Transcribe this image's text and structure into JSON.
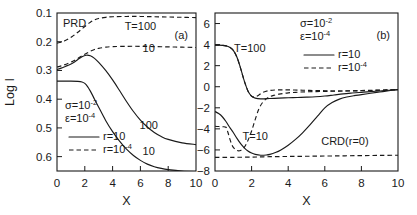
{
  "figure": {
    "width": 417,
    "height": 215,
    "background": "#ffffff",
    "ink": "#1a1a1a"
  },
  "chart_data": [
    {
      "type": "line",
      "panel_label": "(a)",
      "title": "PRD",
      "xlabel": "X",
      "ylabel": "Log I",
      "xlim": [
        0,
        10
      ],
      "ylim": [
        0.1,
        0.65
      ],
      "y_inverted": true,
      "grid": false,
      "xticks": [
        0,
        2,
        4,
        6,
        8,
        10
      ],
      "xtick_labels": [
        "0",
        "2",
        "4",
        "6",
        "8",
        "10"
      ],
      "yticks": [
        0.1,
        0.2,
        0.3,
        0.4,
        0.5,
        0.6
      ],
      "ytick_labels": [
        "0.1",
        "0.2",
        "0.3",
        "0.4",
        "0.5",
        "0.6"
      ],
      "legend": {
        "position": "lower-left",
        "params": [
          {
            "symbol": "σ",
            "value": "10",
            "exponent": "-2"
          },
          {
            "symbol": "ε",
            "value": "10",
            "exponent": "-4"
          }
        ],
        "entries": [
          {
            "style": "solid",
            "label": "r=10",
            "exponent": ""
          },
          {
            "style": "dashed",
            "label": "r=10",
            "exponent": "-4"
          }
        ]
      },
      "annotations": [
        {
          "text": "T=100",
          "x": 6.0,
          "y": 0.158,
          "series": "dashed-T100"
        },
        {
          "text": "10",
          "x": 6.6,
          "y": 0.235,
          "series": "dashed-T10"
        },
        {
          "text": "100",
          "x": 6.6,
          "y": 0.505,
          "series": "solid-T100"
        },
        {
          "text": "10",
          "x": 6.6,
          "y": 0.594,
          "series": "solid-T10"
        }
      ],
      "series": [
        {
          "name": "dashed-T100",
          "style": "dashed",
          "x": [
            0,
            0.3,
            0.6,
            0.9,
            1.2,
            1.5,
            1.8,
            2.1,
            2.4,
            2.7,
            3.0,
            3.5,
            4,
            5,
            6,
            7,
            8,
            9,
            10
          ],
          "y": [
            0.205,
            0.202,
            0.196,
            0.188,
            0.178,
            0.167,
            0.155,
            0.143,
            0.132,
            0.124,
            0.119,
            0.115,
            0.113,
            0.112,
            0.112,
            0.113,
            0.114,
            0.115,
            0.116
          ]
        },
        {
          "name": "dashed-T10",
          "style": "dashed",
          "x": [
            0,
            0.3,
            0.6,
            0.9,
            1.2,
            1.5,
            1.8,
            2.1,
            2.4,
            2.7,
            3.0,
            3.5,
            4,
            5,
            6,
            7,
            8,
            9,
            10
          ],
          "y": [
            0.288,
            0.284,
            0.279,
            0.273,
            0.266,
            0.258,
            0.249,
            0.241,
            0.233,
            0.227,
            0.223,
            0.219,
            0.217,
            0.216,
            0.216,
            0.217,
            0.218,
            0.219,
            0.22
          ]
        },
        {
          "name": "solid-T100",
          "style": "solid",
          "x": [
            0,
            0.3,
            0.6,
            0.9,
            1.2,
            1.5,
            1.8,
            2.1,
            2.4,
            2.7,
            3.0,
            3.5,
            4,
            4.5,
            5,
            5.5,
            6,
            6.5,
            7,
            7.5,
            8,
            9,
            10
          ],
          "y": [
            0.297,
            0.292,
            0.286,
            0.28,
            0.272,
            0.262,
            0.252,
            0.247,
            0.249,
            0.258,
            0.272,
            0.3,
            0.333,
            0.37,
            0.408,
            0.443,
            0.473,
            0.497,
            0.516,
            0.53,
            0.54,
            0.552,
            0.558
          ]
        },
        {
          "name": "solid-T10",
          "style": "solid",
          "x": [
            0,
            0.5,
            1.0,
            1.5,
            1.8,
            2.0,
            2.2,
            2.4,
            2.7,
            3.0,
            3.5,
            4,
            4.5,
            5,
            5.5,
            6,
            6.5,
            7,
            7.5,
            8,
            9,
            10
          ],
          "y": [
            0.337,
            0.337,
            0.337,
            0.338,
            0.34,
            0.345,
            0.356,
            0.372,
            0.4,
            0.428,
            0.474,
            0.513,
            0.546,
            0.574,
            0.596,
            0.613,
            0.626,
            0.635,
            0.641,
            0.645,
            0.65,
            0.652
          ]
        }
      ]
    },
    {
      "type": "line",
      "panel_label": "(b)",
      "xlabel": "X",
      "ylabel": "",
      "xlim": [
        0,
        10
      ],
      "ylim": [
        -8,
        7
      ],
      "y_inverted": false,
      "grid": false,
      "xticks": [
        0,
        2,
        4,
        6,
        8,
        10
      ],
      "xtick_labels": [
        "0",
        "2",
        "4",
        "6",
        "8",
        "10"
      ],
      "yticks": [
        -8,
        -6,
        -4,
        -2,
        0,
        2,
        4,
        6
      ],
      "ytick_labels": [
        "−8",
        "−6",
        "−4",
        "−2",
        "0",
        "2",
        "4",
        "6"
      ],
      "legend": {
        "position": "upper-right",
        "params": [
          {
            "symbol": "σ",
            "value": "10",
            "exponent": "-2"
          },
          {
            "symbol": "ε",
            "value": "10",
            "exponent": "-4"
          }
        ],
        "entries": [
          {
            "style": "solid",
            "label": "r=10",
            "exponent": ""
          },
          {
            "style": "dashed",
            "label": "r=10",
            "exponent": "-4"
          }
        ]
      },
      "annotations": [
        {
          "text": "T=100",
          "x": 1.9,
          "y": 3.3,
          "series": "solid-T100"
        },
        {
          "text": "T=10",
          "x": 2.2,
          "y": -5.05,
          "series": "solid-T10"
        },
        {
          "text": "CRD(r=0)",
          "x": 7.1,
          "y": -5.5,
          "series": "dashed-CRD"
        }
      ],
      "series": [
        {
          "name": "solid-T100",
          "style": "solid",
          "x": [
            0,
            0.2,
            0.4,
            0.6,
            0.8,
            1.0,
            1.2,
            1.4,
            1.6,
            1.8,
            2.0,
            2.2,
            2.5,
            3,
            3.5,
            4,
            4.5,
            5,
            5.5,
            6,
            6.5,
            7,
            7.5,
            8,
            8.5,
            9,
            9.5,
            10
          ],
          "y": [
            3.95,
            3.95,
            3.93,
            3.88,
            3.75,
            3.45,
            2.8,
            1.75,
            0.55,
            -0.4,
            -0.9,
            -1.08,
            -1.15,
            -1.12,
            -1.08,
            -1.05,
            -1.02,
            -0.99,
            -0.95,
            -0.88,
            -0.78,
            -0.68,
            -0.6,
            -0.53,
            -0.46,
            -0.4,
            -0.33,
            -0.27
          ]
        },
        {
          "name": "dashed-T100",
          "style": "dashed",
          "x": [
            0,
            0.2,
            0.4,
            0.6,
            0.8,
            1.0,
            1.2,
            1.4,
            1.6,
            1.8,
            2.0,
            2.2,
            2.4,
            2.6,
            3,
            3.5,
            4,
            4.5,
            5,
            5.5,
            6,
            6.5,
            7,
            7.5,
            8,
            8.5,
            9,
            9.5,
            10
          ],
          "y": [
            3.95,
            3.95,
            3.93,
            3.88,
            3.75,
            3.45,
            2.8,
            1.75,
            0.55,
            -0.4,
            -0.9,
            -0.95,
            -0.78,
            -0.55,
            -0.35,
            -0.3,
            -0.3,
            -0.32,
            -0.34,
            -0.36,
            -0.38,
            -0.4,
            -0.4,
            -0.4,
            -0.38,
            -0.36,
            -0.33,
            -0.3,
            -0.27
          ]
        },
        {
          "name": "solid-T10",
          "style": "solid",
          "x": [
            0,
            0.2,
            0.4,
            0.6,
            0.8,
            1.0,
            1.2,
            1.4,
            1.6,
            1.8,
            2.0,
            2.2,
            2.5,
            2.8,
            3.0,
            3.3,
            3.6,
            4,
            4.4,
            4.8,
            5.2,
            5.6,
            6,
            6.4,
            6.8,
            7.2,
            7.6,
            8,
            8.5,
            9,
            9.5,
            10
          ],
          "y": [
            -2.35,
            -2.55,
            -2.85,
            -3.3,
            -3.85,
            -4.35,
            -4.9,
            -5.4,
            -5.8,
            -6.1,
            -6.3,
            -6.42,
            -6.5,
            -6.48,
            -6.42,
            -6.25,
            -6.0,
            -5.55,
            -5.0,
            -4.35,
            -3.6,
            -2.8,
            -2.0,
            -1.5,
            -1.18,
            -0.98,
            -0.85,
            -0.75,
            -0.62,
            -0.5,
            -0.38,
            -0.27
          ]
        },
        {
          "name": "dashed-T10",
          "style": "dashed",
          "x": [
            0,
            0.2,
            0.4,
            0.6,
            0.7,
            0.8,
            0.9,
            1.0,
            1.2,
            1.4,
            1.6,
            1.8,
            2.0,
            2.2,
            2.4,
            2.6,
            2.8,
            3.0,
            3.2,
            3.5,
            4,
            4.5,
            5,
            5.5,
            6,
            6.5,
            7,
            7.5,
            8,
            8.5,
            9,
            9.5,
            10
          ],
          "y": [
            -3.75,
            -3.78,
            -3.8,
            -3.85,
            -4.3,
            -4.9,
            -5.4,
            -5.75,
            -6.05,
            -6.05,
            -5.75,
            -5.1,
            -4.2,
            -3.1,
            -2.1,
            -1.5,
            -1.15,
            -0.95,
            -0.82,
            -0.7,
            -0.58,
            -0.52,
            -0.48,
            -0.46,
            -0.44,
            -0.42,
            -0.4,
            -0.38,
            -0.36,
            -0.34,
            -0.32,
            -0.3,
            -0.27
          ]
        },
        {
          "name": "dashed-CRD",
          "style": "dashed",
          "x": [
            0,
            1,
            2,
            2.5,
            3,
            4,
            5,
            6,
            7,
            8,
            9,
            10
          ],
          "y": [
            -6.7,
            -6.7,
            -6.68,
            -6.66,
            -6.64,
            -6.62,
            -6.6,
            -6.58,
            -6.56,
            -6.54,
            -6.52,
            -6.5
          ]
        }
      ]
    }
  ]
}
